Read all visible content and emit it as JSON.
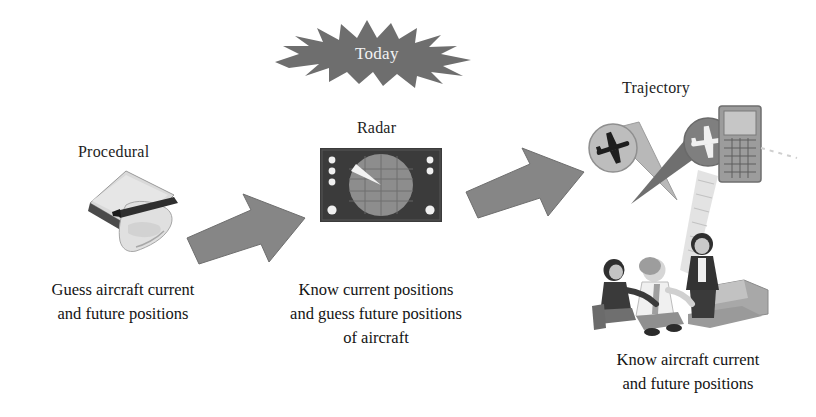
{
  "diagram": {
    "title_banner": {
      "label": "Today",
      "shape": "starburst",
      "fill_color": "#6e6e6e",
      "text_color": "#f2f2f2"
    },
    "stages": [
      {
        "id": "procedural",
        "label": "Procedural",
        "icon": "hand-writing-on-paper-icon",
        "caption_lines": [
          "Guess aircraft current",
          "and future positions"
        ]
      },
      {
        "id": "radar",
        "label": "Radar",
        "icon": "radar-scope-icon",
        "caption_lines": [
          "Know current positions",
          "and guess future positions",
          "of aircraft"
        ]
      },
      {
        "id": "trajectory",
        "label": "Trajectory",
        "icon": "aircraft-trajectory-cones-icon",
        "caption_lines": [
          "Know aircraft current",
          "and future positions"
        ]
      }
    ],
    "arrows": [
      {
        "id": "arrow-procedural-to-radar",
        "direction": "up-right"
      },
      {
        "id": "arrow-radar-to-trajectory",
        "direction": "up-right"
      }
    ],
    "colors": {
      "arrow_fill": "#848484",
      "arrow_stroke": "#6a6a6a",
      "radar_body": "#3b3b3b",
      "radar_scope": "#8a8a8a",
      "radar_sweep": "#f0f0f0",
      "paper_light": "#d8d8d8",
      "paper_shadow": "#8c8c8c",
      "cone_light": "#b6b6b6",
      "cone_dark": "#6f6f6f",
      "people_dark": "#3a3a3a",
      "people_mid": "#9a9a9a",
      "people_light": "#e2e2e2",
      "text": "#141414"
    }
  }
}
